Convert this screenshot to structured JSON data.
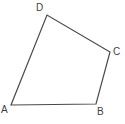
{
  "figure": {
    "name": "quadrilateral-ABCD",
    "shape_type": "quadrilateral",
    "background_color": "#ffffff",
    "stroke_color": "#4a4a4a",
    "stroke_width": 1.2,
    "fill": "none",
    "canvas": {
      "width": 125,
      "height": 124
    },
    "vertices": [
      {
        "id": "A",
        "label": "A",
        "x": 11,
        "y": 105,
        "label_x": 1,
        "label_y": 105
      },
      {
        "id": "B",
        "label": "B",
        "x": 96,
        "y": 104,
        "label_x": 97,
        "label_y": 107
      },
      {
        "id": "C",
        "label": "C",
        "x": 110,
        "y": 52,
        "label_x": 113,
        "label_y": 47
      },
      {
        "id": "D",
        "label": "D",
        "x": 47,
        "y": 15,
        "label_x": 36,
        "label_y": 3
      }
    ],
    "edges": [
      {
        "id": "AB",
        "from": "A",
        "to": "B"
      },
      {
        "id": "BC",
        "from": "B",
        "to": "C"
      },
      {
        "id": "CD",
        "from": "C",
        "to": "D"
      },
      {
        "id": "DA",
        "from": "D",
        "to": "A"
      }
    ],
    "path": "M 11 105 L 96 104 L 110 52 L 47 15 Z",
    "label_color": "#3f3f3f",
    "label_font_size_px": 10
  }
}
